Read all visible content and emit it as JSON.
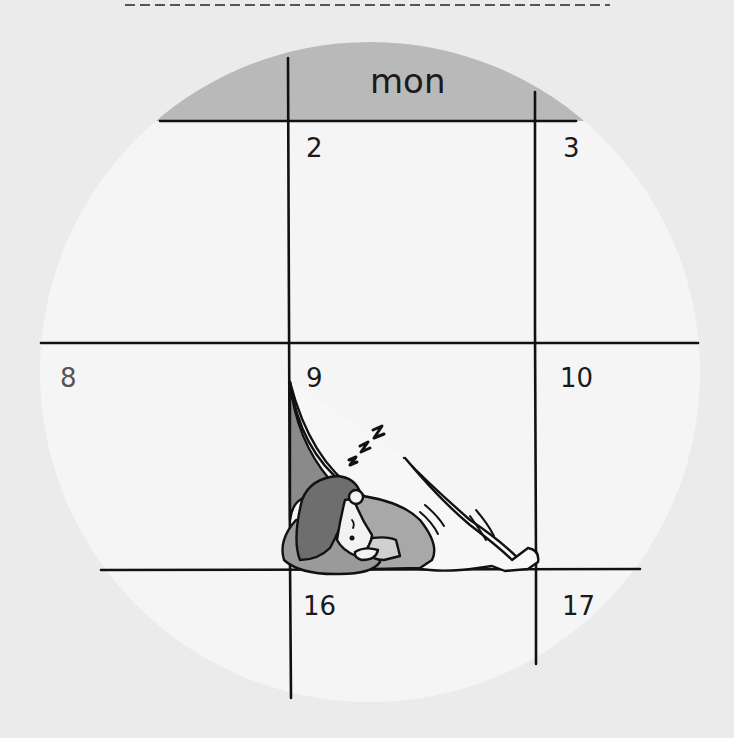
{
  "calendar": {
    "day_header": "mon",
    "dates": [
      {
        "label": "2",
        "x": 306,
        "y": 135,
        "muted": false
      },
      {
        "label": "3",
        "x": 563,
        "y": 135,
        "muted": false
      },
      {
        "label": "8",
        "x": 60,
        "y": 365,
        "muted": true
      },
      {
        "label": "9",
        "x": 306,
        "y": 365,
        "muted": false
      },
      {
        "label": "10",
        "x": 560,
        "y": 365,
        "muted": false
      },
      {
        "label": "16",
        "x": 303,
        "y": 593,
        "muted": false
      },
      {
        "label": "17",
        "x": 562,
        "y": 593,
        "muted": false
      }
    ]
  },
  "illustration": {
    "subject": "person sleeping under calendar page like a blanket",
    "snore_text": "z z z"
  },
  "colors": {
    "background": "#ebebeb",
    "circle": "#f5f5f5",
    "header_cap": "#b9b9b9",
    "line": "#111111",
    "hair": "#6e6e6e",
    "body": "#9a9a9a",
    "shadow": "#8a8a8a"
  }
}
